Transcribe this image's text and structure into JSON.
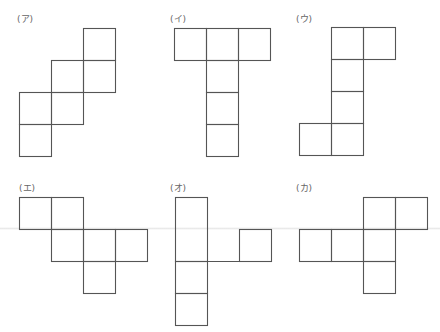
{
  "figures": [
    {
      "label": "(ア)",
      "label_pos": [
        17,
        12
      ],
      "cell": 32,
      "cells": [
        [
          83,
          28
        ],
        [
          51,
          60
        ],
        [
          83,
          60
        ],
        [
          19,
          92
        ],
        [
          51,
          92
        ],
        [
          19,
          124
        ]
      ]
    },
    {
      "label": "(イ)",
      "label_pos": [
        170,
        12
      ],
      "cell": 32,
      "cells": [
        [
          174,
          28
        ],
        [
          206,
          28
        ],
        [
          238,
          28
        ],
        [
          206,
          60
        ],
        [
          206,
          92
        ],
        [
          206,
          124
        ]
      ]
    },
    {
      "label": "(ウ)",
      "label_pos": [
        296,
        12
      ],
      "cell": 32,
      "cells": [
        [
          331,
          27
        ],
        [
          363,
          27
        ],
        [
          331,
          59
        ],
        [
          331,
          91
        ],
        [
          299,
          123
        ],
        [
          331,
          123
        ]
      ]
    },
    {
      "label": "(エ)",
      "label_pos": [
        19,
        181
      ],
      "cell": 32,
      "cells": [
        [
          19,
          197
        ],
        [
          51,
          197
        ],
        [
          51,
          229
        ],
        [
          83,
          229
        ],
        [
          115,
          229
        ],
        [
          83,
          261
        ]
      ]
    },
    {
      "label": "(オ)",
      "label_pos": [
        170,
        181
      ],
      "cell": 32,
      "rects": [
        [
          175,
          197,
          32,
          64
        ],
        [
          239,
          229,
          32,
          32
        ],
        [
          175,
          261,
          32,
          32
        ],
        [
          175,
          293,
          32,
          32
        ]
      ],
      "lines": [
        [
          207,
          261,
          239,
          261
        ]
      ]
    },
    {
      "label": "(カ)",
      "label_pos": [
        296,
        181
      ],
      "cell": 32,
      "cells": [
        [
          363,
          197
        ],
        [
          395,
          197
        ],
        [
          299,
          229
        ],
        [
          331,
          229
        ],
        [
          363,
          229
        ],
        [
          363,
          261
        ]
      ]
    }
  ],
  "colors": {
    "stroke": "#555555",
    "label": "#666666"
  }
}
